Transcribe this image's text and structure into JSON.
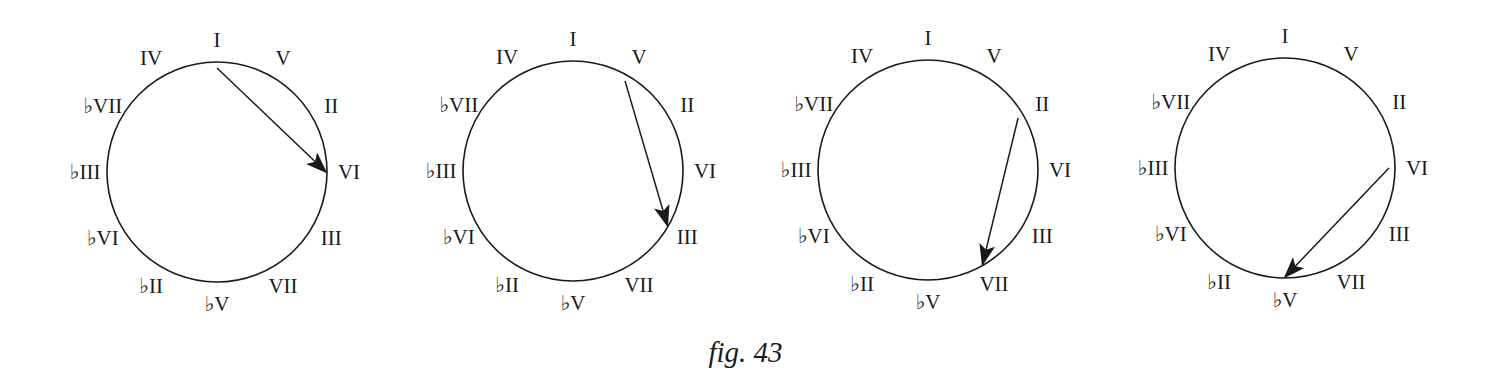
{
  "figure": {
    "caption": "fig. 43",
    "circle_labels_clockwise_from_top": [
      "I",
      "V",
      "II",
      "VI",
      "III",
      "VII",
      "♭V",
      "♭II",
      "♭VI",
      "♭III",
      "♭VII",
      "IV"
    ],
    "diagrams": [
      {
        "id": 1,
        "center": [
          217,
          172
        ],
        "arrow": {
          "from": "I",
          "to": "VI"
        }
      },
      {
        "id": 2,
        "center": [
          573,
          171
        ],
        "arrow": {
          "from": "V",
          "to": "III"
        }
      },
      {
        "id": 3,
        "center": [
          928,
          170
        ],
        "arrow": {
          "from": "II",
          "to": "VII"
        }
      },
      {
        "id": 4,
        "center": [
          1285,
          168
        ],
        "arrow": {
          "from": "VI",
          "to": "♭V"
        }
      }
    ],
    "radius": 110,
    "colors": {
      "ink": "#1a1a1a",
      "background": "#ffffff"
    }
  }
}
